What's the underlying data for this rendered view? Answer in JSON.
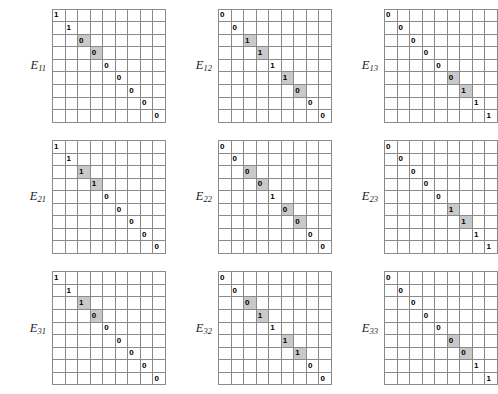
{
  "figure": {
    "grid_rows": 9,
    "grid_cols": 9,
    "shade_color": "#c9c9c9",
    "line_color": "#8a8a8a",
    "text_color": "#000000"
  },
  "panels": [
    {
      "name": "E11",
      "label_base": "E",
      "label_sub": "11",
      "diagonal": [
        "1",
        "1",
        "0",
        "0",
        "0",
        "0",
        "0",
        "0",
        "0"
      ],
      "shaded": [
        2,
        3
      ]
    },
    {
      "name": "E12",
      "label_base": "E",
      "label_sub": "12",
      "diagonal": [
        "0",
        "0",
        "1",
        "1",
        "1",
        "1",
        "0",
        "0",
        "0"
      ],
      "shaded": [
        2,
        3,
        5,
        6
      ]
    },
    {
      "name": "E13",
      "label_base": "E",
      "label_sub": "13",
      "diagonal": [
        "0",
        "0",
        "0",
        "0",
        "0",
        "0",
        "1",
        "1",
        "1"
      ],
      "shaded": [
        5,
        6
      ]
    },
    {
      "name": "E21",
      "label_base": "E",
      "label_sub": "21",
      "diagonal": [
        "1",
        "1",
        "1",
        "1",
        "0",
        "0",
        "0",
        "0",
        "0"
      ],
      "shaded": [
        2,
        3
      ]
    },
    {
      "name": "E22",
      "label_base": "E",
      "label_sub": "22",
      "diagonal": [
        "0",
        "0",
        "0",
        "0",
        "1",
        "0",
        "0",
        "0",
        "0"
      ],
      "shaded": [
        2,
        3,
        5,
        6
      ]
    },
    {
      "name": "E23",
      "label_base": "E",
      "label_sub": "23",
      "diagonal": [
        "0",
        "0",
        "0",
        "0",
        "0",
        "1",
        "1",
        "1",
        "1"
      ],
      "shaded": [
        5,
        6
      ]
    },
    {
      "name": "E31",
      "label_base": "E",
      "label_sub": "31",
      "diagonal": [
        "1",
        "1",
        "1",
        "0",
        "0",
        "0",
        "0",
        "0",
        "0"
      ],
      "shaded": [
        2,
        3
      ]
    },
    {
      "name": "E32",
      "label_base": "E",
      "label_sub": "32",
      "diagonal": [
        "0",
        "0",
        "0",
        "1",
        "1",
        "1",
        "1",
        "0",
        "0"
      ],
      "shaded": [
        2,
        3,
        5,
        6
      ]
    },
    {
      "name": "E33",
      "label_base": "E",
      "label_sub": "33",
      "diagonal": [
        "0",
        "0",
        "0",
        "0",
        "0",
        "0",
        "0",
        "1",
        "1"
      ],
      "shaded": [
        5,
        6
      ]
    }
  ]
}
